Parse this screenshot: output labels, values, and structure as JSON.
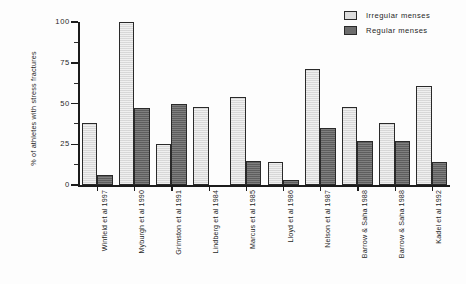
{
  "chart_data": {
    "type": "bar",
    "title": "",
    "xlabel": "",
    "ylabel": "% of athletes with stress fractures",
    "ylim": [
      0,
      100
    ],
    "ytick_values": [
      0,
      25,
      50,
      75,
      100
    ],
    "ytick_labels": [
      "0",
      "25",
      "50",
      "75",
      "100"
    ],
    "yminor_interval": 12.5,
    "grid": false,
    "legend_position": "top-right",
    "categories": [
      "Winfield et al 1997",
      "Myburgh et al 1990",
      "Grimston et al 1991",
      "Lindberg et al 1984",
      "Marcus et al 1985",
      "Lloyd et al 1986",
      "Nelson et al 1987",
      "Barrow & Saha 1988",
      "Barrow & Saha 1988",
      "Kadel et al 1992"
    ],
    "series": [
      {
        "name": "Irregular menses",
        "color": "#dddddd",
        "values": [
          38,
          100,
          25,
          48,
          54,
          14,
          71,
          48,
          38,
          61
        ]
      },
      {
        "name": "Regular menses",
        "color": "#6d6d6d",
        "values": [
          6,
          47,
          50,
          null,
          15,
          3,
          35,
          27,
          27,
          14
        ]
      }
    ]
  },
  "legend": {
    "items": [
      {
        "label": "Irregular menses",
        "swatch": "light"
      },
      {
        "label": "Regular menses",
        "swatch": "dark"
      }
    ]
  }
}
